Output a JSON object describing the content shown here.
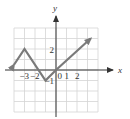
{
  "figure": {
    "type": "function-graph",
    "axes": {
      "x_label": "x",
      "y_label": "y",
      "x_range": [
        -4,
        4
      ],
      "y_range": [
        -4,
        4
      ],
      "grid": true,
      "grid_step": 1
    },
    "tick_labels": {
      "x": [
        {
          "value": -3,
          "text": "−3"
        },
        {
          "value": -2,
          "text": "−2"
        },
        {
          "value": 0,
          "text": "0"
        },
        {
          "value": 1,
          "text": "1"
        },
        {
          "value": 2,
          "text": "2"
        }
      ],
      "y": [
        {
          "value": 2,
          "text": "2"
        },
        {
          "value": -1,
          "text": "−1"
        }
      ]
    },
    "curve": {
      "points": [
        [
          -4,
          0.5
        ],
        [
          -3,
          2
        ],
        [
          -1,
          -1
        ],
        [
          0,
          0
        ],
        [
          3.3,
          3
        ]
      ],
      "start_arrow": true,
      "end_arrow": true,
      "color": "#777777"
    },
    "colors": {
      "grid": "#d4d4d4",
      "axis": "#333333",
      "curve": "#7a7a7a"
    }
  }
}
